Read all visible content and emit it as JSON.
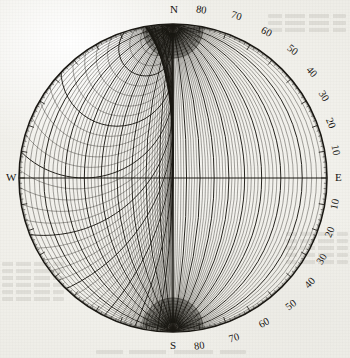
{
  "figure": {
    "kind": "stereographic-projection-net",
    "name": "Wulff net",
    "center_x": 173,
    "center_y": 178,
    "radius": 154,
    "fine_grid_step_deg": 2,
    "bold_grid_step_deg": 10,
    "ink_color": "#1a1813",
    "paper_color": "#f3f2ee"
  },
  "cardinals": [
    {
      "label": "N",
      "x": 170,
      "y": 4,
      "angle_deg": 0
    },
    {
      "label": "E",
      "x": 335,
      "y": 172,
      "angle_deg": 90
    },
    {
      "label": "S",
      "x": 170,
      "y": 340,
      "angle_deg": 180
    },
    {
      "label": "W",
      "x": 6,
      "y": 172,
      "angle_deg": 270
    }
  ],
  "graduations": {
    "top_right": [
      {
        "value": "80",
        "x": 196,
        "y": 5
      },
      {
        "value": "70",
        "x": 231,
        "y": 11
      }
    ],
    "right_upper": [
      {
        "value": "60",
        "x": 261,
        "y": 27
      },
      {
        "value": "50",
        "x": 287,
        "y": 45
      },
      {
        "value": "40",
        "x": 306,
        "y": 67
      },
      {
        "value": "30",
        "x": 318,
        "y": 91
      },
      {
        "value": "20",
        "x": 325,
        "y": 118
      },
      {
        "value": "10",
        "x": 330,
        "y": 145
      }
    ],
    "right_lower": [
      {
        "value": "10",
        "x": 330,
        "y": 199
      },
      {
        "value": "20",
        "x": 325,
        "y": 227
      },
      {
        "value": "30",
        "x": 317,
        "y": 254
      },
      {
        "value": "40",
        "x": 305,
        "y": 278
      },
      {
        "value": "50",
        "x": 286,
        "y": 300
      },
      {
        "value": "60",
        "x": 259,
        "y": 318
      }
    ],
    "bottom_right": [
      {
        "value": "70",
        "x": 229,
        "y": 333
      },
      {
        "value": "80",
        "x": 194,
        "y": 341
      }
    ]
  }
}
